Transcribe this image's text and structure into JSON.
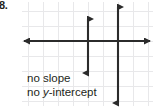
{
  "figure": {
    "problem_label": "8.",
    "background_color": "#ffffff",
    "width": 155,
    "height": 110
  },
  "annotation": {
    "line1": "no slope",
    "line2_prefix": "no ",
    "line2_variable": "y",
    "line2_suffix": "-intercept",
    "color": "#231f20"
  },
  "chart_data": {
    "type": "line",
    "title": "",
    "xlabel": "",
    "ylabel": "",
    "grid": true,
    "grid_color": "#e8e8ea",
    "grid_spacing_px": 15,
    "axis_color": "#2b2b2b",
    "axes": {
      "x_axis": {
        "name": "x-axis",
        "orientation": "horizontal",
        "y_px": 41,
        "x_start_px": 19,
        "x_end_px": 155,
        "arrow_start": true,
        "arrow_end": true
      },
      "y_axis": {
        "name": "y-axis",
        "orientation": "vertical",
        "x_px": 88,
        "y_start_px": 14,
        "y_end_px": 78,
        "arrow_start": true,
        "arrow_end": true
      }
    },
    "series": [
      {
        "name": "vertical-line",
        "type": "vertical-line",
        "orientation": "vertical",
        "x_px": 118,
        "y_start_px": 2,
        "y_end_px": 108,
        "arrow_start": true,
        "arrow_end": true,
        "slope": "undefined",
        "y_intercept": "none",
        "color": "#2b2b2b"
      }
    ],
    "legend": null,
    "annotations": [
      "no slope",
      "no y-intercept"
    ]
  }
}
